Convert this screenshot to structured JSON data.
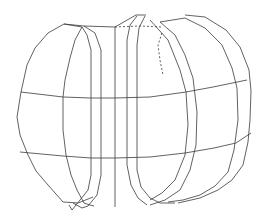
{
  "figure": {
    "stroke_color": "#3a3a3a",
    "background": "#ffffff"
  }
}
